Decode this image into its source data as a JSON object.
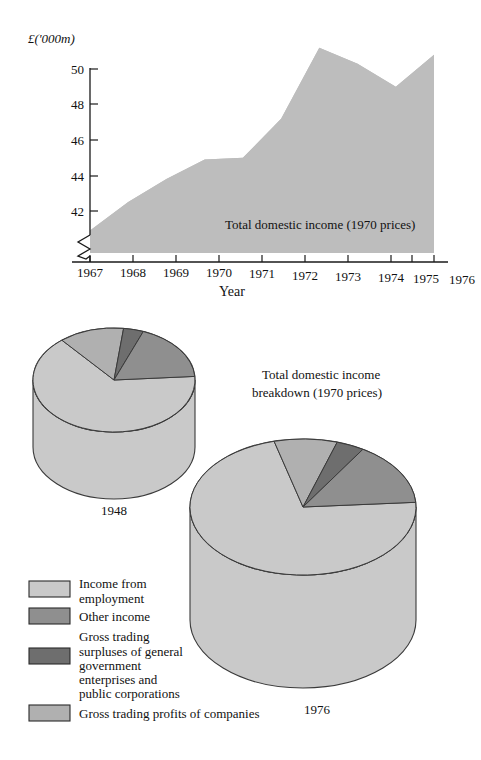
{
  "figure": {
    "background": "#ffffff",
    "width": 481,
    "height": 760
  },
  "palette": {
    "income_from_employment": "#c9c9c9",
    "other_income": "#8f8f8f",
    "gross_trading_surpluses": "#6e6e6e",
    "gross_trading_profits": "#b0b0b0",
    "area_fill": "#bdbdbd",
    "outline": "#3a3a3a",
    "axis": "#1a1a1a",
    "text": "#111111"
  },
  "area_chart": {
    "unit_label": "£('000m)",
    "x_axis_name": "Year",
    "series_label": "Total domestic income (1970 prices)",
    "y_ticks": [
      "42",
      "44",
      "46",
      "48",
      "50"
    ],
    "x_ticks": [
      "1967",
      "1968",
      "1969",
      "1970",
      "1971",
      "1972",
      "1973",
      "1974",
      "1975",
      "1976"
    ],
    "axis_break": true
  },
  "pies_title": {
    "line1": "Total domestic income",
    "line2": "breakdown (1970 prices)"
  },
  "pies": [
    {
      "year_label": "1948"
    },
    {
      "year_label": "1976"
    }
  ],
  "legend": {
    "items": [
      {
        "label": "Income from\nemployment",
        "color_key": "income_from_employment"
      },
      {
        "label": "Other income",
        "color_key": "other_income"
      },
      {
        "label": "Gross trading\nsurpluses of general\ngovernment\nenterprises and\npublic corporations",
        "color_key": "gross_trading_surpluses"
      },
      {
        "label": "Gross trading profits of companies",
        "color_key": "gross_trading_profits"
      }
    ]
  },
  "chart_data": [
    {
      "type": "area",
      "title": "Total domestic income (1970 prices)",
      "xlabel": "Year",
      "ylabel": "£('000m)",
      "x": [
        1967,
        1968,
        1969,
        1970,
        1971,
        1972,
        1973,
        1974,
        1975,
        1976
      ],
      "values": [
        40.9,
        42.5,
        43.8,
        44.9,
        45.0,
        47.2,
        51.2,
        50.3,
        49.0,
        50.8
      ],
      "ylim": [
        40.6,
        50.9
      ],
      "y_ticks": [
        42,
        44,
        46,
        48,
        50
      ],
      "axis_break": true,
      "grid": false,
      "legend": "none"
    },
    {
      "type": "pie",
      "title": "1948",
      "labels": [
        "Income from employment",
        "Gross trading profits of companies",
        "Gross trading surpluses of general government enterprises and public corporations",
        "Other income"
      ],
      "values": [
        65,
        13,
        4,
        18
      ],
      "legend": "bottom-left"
    },
    {
      "type": "pie",
      "title": "1976",
      "labels": [
        "Income from employment",
        "Gross trading profits of companies",
        "Gross trading surpluses of general government enterprises and public corporations",
        "Other income"
      ],
      "values": [
        72,
        9,
        4,
        15
      ],
      "legend": "bottom-left"
    }
  ]
}
